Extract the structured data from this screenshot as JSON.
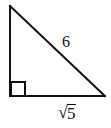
{
  "figure": {
    "type": "right-triangle",
    "background_color": "#ffffff",
    "stroke_color": "#111111",
    "stroke_width": 2,
    "vertices": {
      "apex_top_left": [
        10,
        6
      ],
      "right_angle_bottom_left": [
        10,
        96
      ],
      "bottom_right": [
        105,
        96
      ]
    },
    "right_angle_marker": {
      "name": "right-angle-square",
      "x": 11,
      "y": 82,
      "size": 14,
      "filled": false
    },
    "labels": {
      "hypotenuse": {
        "text": "6",
        "side": "hypotenuse",
        "x": 62,
        "y": 34
      },
      "base": {
        "radical_sign": "√",
        "radicand": "5",
        "full_text": "√5",
        "side": "base",
        "x": 58,
        "y": 103
      },
      "vertical_leg": {
        "text": ""
      }
    }
  }
}
